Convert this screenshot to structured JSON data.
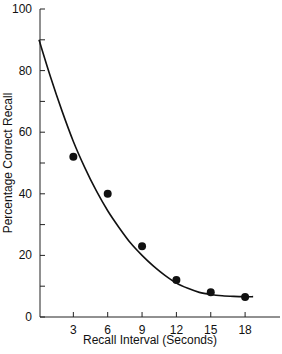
{
  "chart_data": {
    "type": "scatter",
    "title": "",
    "xlabel": "Recall Interval (Seconds)",
    "ylabel": "Percentage Correct Recall",
    "xlim": [
      0,
      20
    ],
    "ylim": [
      0,
      100
    ],
    "x_ticks": [
      3,
      6,
      9,
      12,
      15,
      18
    ],
    "y_ticks": [
      0,
      20,
      40,
      60,
      80,
      100
    ],
    "y_minor_ticks": [
      10,
      30,
      50,
      70,
      90
    ],
    "grid": false,
    "legend": null,
    "series": [
      {
        "name": "Observed recall",
        "type": "scatter",
        "x": [
          3,
          6,
          9,
          12,
          15,
          18
        ],
        "y": [
          52,
          40,
          23,
          12,
          8,
          6.5
        ]
      },
      {
        "name": "Fitted decay curve",
        "type": "line",
        "x": [
          0,
          1,
          2,
          3,
          4,
          5,
          6,
          7,
          8,
          9,
          10,
          11,
          12,
          13,
          14,
          15,
          16,
          17,
          18,
          18.7
        ],
        "y": [
          90,
          78,
          67,
          57,
          48.5,
          41,
          34.5,
          29,
          24,
          20,
          16.5,
          13.5,
          11,
          9.3,
          8,
          7.3,
          6.9,
          6.7,
          6.6,
          6.6
        ]
      }
    ]
  }
}
